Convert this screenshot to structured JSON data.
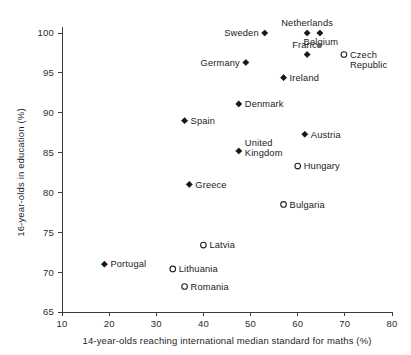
{
  "chart_data": {
    "type": "scatter",
    "title": "",
    "xlabel": "14-year-olds reaching international median standard for maths (%)",
    "ylabel": "16-year-olds in education (%)",
    "xlim": [
      10,
      80
    ],
    "ylim": [
      65,
      100
    ],
    "xticks": [
      10,
      20,
      30,
      40,
      50,
      60,
      70,
      80
    ],
    "yticks": [
      65,
      70,
      75,
      80,
      85,
      90,
      95,
      100
    ],
    "grid": false,
    "legend": "none",
    "marker_styles": {
      "filled": "filled-diamond",
      "open": "open-circle"
    },
    "points": [
      {
        "label": "Sweden",
        "x": 53.0,
        "y": 100.0,
        "marker": "filled",
        "label_pos": "left"
      },
      {
        "label": "Netherlands",
        "x": 62.0,
        "y": 100.0,
        "marker": "filled",
        "label_pos": "above"
      },
      {
        "label": "Belgium",
        "x": 64.7,
        "y": 100.0,
        "marker": "filled",
        "label_pos": "below-right"
      },
      {
        "label": "France",
        "x": 62.0,
        "y": 97.3,
        "marker": "filled",
        "label_pos": "above"
      },
      {
        "label": "Czech Republic",
        "x": 69.8,
        "y": 97.3,
        "marker": "open",
        "label_pos": "right"
      },
      {
        "label": "Germany",
        "x": 49.0,
        "y": 96.3,
        "marker": "filled",
        "label_pos": "left"
      },
      {
        "label": "Ireland",
        "x": 57.0,
        "y": 94.4,
        "marker": "filled",
        "label_pos": "right"
      },
      {
        "label": "Denmark",
        "x": 47.5,
        "y": 91.1,
        "marker": "filled",
        "label_pos": "right"
      },
      {
        "label": "Spain",
        "x": 36.0,
        "y": 89.0,
        "marker": "filled",
        "label_pos": "right"
      },
      {
        "label": "Austria",
        "x": 61.5,
        "y": 87.3,
        "marker": "filled",
        "label_pos": "right"
      },
      {
        "label": "United Kingdom",
        "x": 47.5,
        "y": 85.2,
        "marker": "filled",
        "label_pos": "right-two-line"
      },
      {
        "label": "Hungary",
        "x": 60.0,
        "y": 83.3,
        "marker": "open",
        "label_pos": "right"
      },
      {
        "label": "Greece",
        "x": 37.0,
        "y": 81.0,
        "marker": "filled",
        "label_pos": "right"
      },
      {
        "label": "Bulgaria",
        "x": 57.0,
        "y": 78.5,
        "marker": "open",
        "label_pos": "right"
      },
      {
        "label": "Latvia",
        "x": 40.0,
        "y": 73.4,
        "marker": "open",
        "label_pos": "right"
      },
      {
        "label": "Portugal",
        "x": 19.0,
        "y": 71.0,
        "marker": "filled",
        "label_pos": "right"
      },
      {
        "label": "Lithuania",
        "x": 33.5,
        "y": 70.4,
        "marker": "open",
        "label_pos": "right"
      },
      {
        "label": "Romania",
        "x": 36.0,
        "y": 68.2,
        "marker": "open",
        "label_pos": "right"
      }
    ]
  }
}
